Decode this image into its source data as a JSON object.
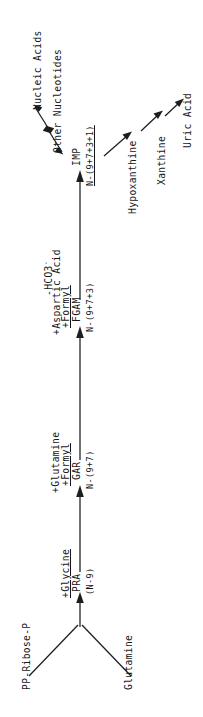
{
  "figure": {
    "type": "pathway-diagram",
    "orientation": "rotated-90-ccw",
    "background_color": "#ffffff",
    "ink_color": "#1d1d1d"
  },
  "nodes": {
    "pp_ribose_p": "PP-Ribose-P",
    "glutamine": "Glutamine",
    "pra": "PRA",
    "pra_n": "(N-9)",
    "gar": "GAR",
    "gar_n": "N-(9+7)",
    "fgam": "FGAM",
    "fgam_n": "N-(9+7+3)",
    "imp": "IMP",
    "imp_n": "N-(9+7+3+1)",
    "other_nucleotides": "Other Nucleotides",
    "nucleic_acids": "Nucleic Acids",
    "hypoxanthine": "Hypoxanthine",
    "xanthine": "Xanthine",
    "uric_acid": "Uric Acid"
  },
  "reagents": {
    "step1": "+Glycine",
    "step2_a": "+Glutamine",
    "step2_b": "+Formyl",
    "step3_a": "-HCO3",
    "step3_a_charge": "-",
    "step3_b": "+Aspartic Acid",
    "step3_c": "+Formyl"
  },
  "arrows": [
    {
      "name": "pp-ribose-p-to-pra",
      "kind": "single"
    },
    {
      "name": "glutamine-to-pra",
      "kind": "single"
    },
    {
      "name": "pra-to-gar",
      "kind": "single"
    },
    {
      "name": "gar-to-fgam",
      "kind": "single"
    },
    {
      "name": "fgam-to-imp",
      "kind": "single"
    },
    {
      "name": "imp-to-other-nucleotides",
      "kind": "double"
    },
    {
      "name": "other-nucleotides-to-nucleic-acids",
      "kind": "double"
    },
    {
      "name": "imp-to-hypoxanthine",
      "kind": "single"
    },
    {
      "name": "hypoxanthine-to-xanthine",
      "kind": "single"
    },
    {
      "name": "xanthine-to-uric-acid",
      "kind": "single"
    }
  ]
}
